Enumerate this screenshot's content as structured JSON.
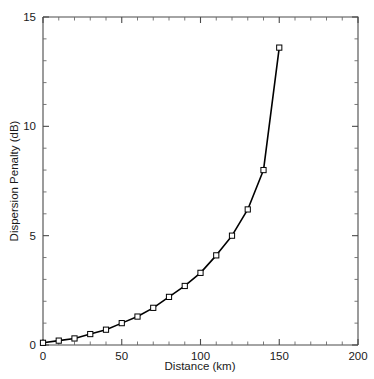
{
  "chart_data": {
    "type": "line",
    "title": "",
    "xlabel": "Distance (km)",
    "ylabel": "Dispersion Penalty (dB)",
    "xlim": [
      0,
      200
    ],
    "ylim": [
      0,
      15
    ],
    "xticks": [
      0,
      50,
      100,
      150,
      200
    ],
    "xtick_labels": [
      "0",
      "50",
      "100",
      "150",
      "200"
    ],
    "yticks": [
      0,
      5,
      10,
      15
    ],
    "ytick_labels": [
      "0",
      "5",
      "10",
      "15"
    ],
    "x_minor_step": 10,
    "y_minor_step": 1,
    "grid": false,
    "legend": null,
    "marker": "open-square",
    "line_color": "#000000",
    "marker_face_color": "#ffffff",
    "marker_edge_color": "#000000",
    "axis_color": "#4a4a4a",
    "series": [
      {
        "name": "Dispersion Penalty",
        "x": [
          0,
          10,
          20,
          30,
          40,
          50,
          60,
          70,
          80,
          90,
          100,
          110,
          120,
          130,
          140,
          150
        ],
        "values": [
          0.1,
          0.2,
          0.3,
          0.5,
          0.7,
          1.0,
          1.3,
          1.7,
          2.2,
          2.7,
          3.3,
          4.1,
          5.0,
          6.2,
          8.0,
          13.6
        ]
      }
    ]
  },
  "axis": {
    "x_title": "Distance (km)",
    "y_title": "Dispersion Penalty (dB)"
  }
}
